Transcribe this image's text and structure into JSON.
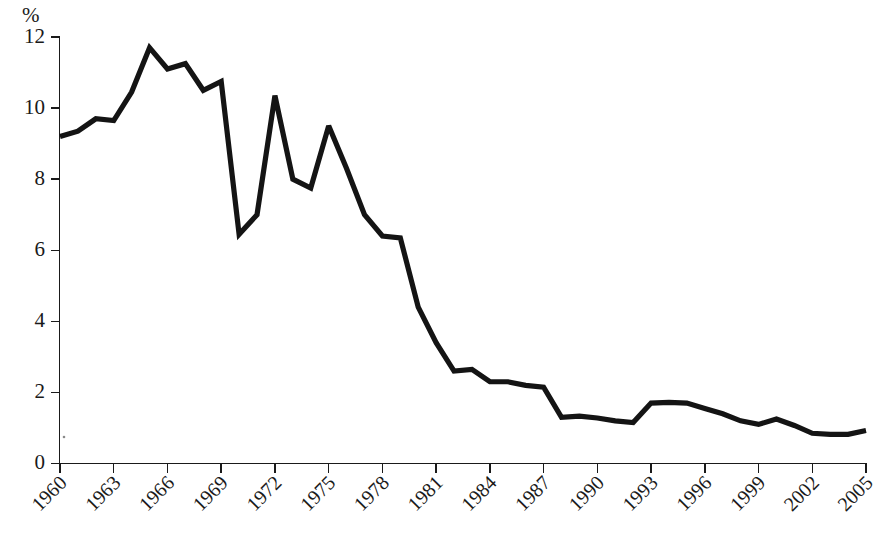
{
  "chart_data": {
    "type": "line",
    "title": "",
    "subtitle": "",
    "xlabel": "",
    "ylabel": "%",
    "ylim": [
      0,
      12
    ],
    "xlim": [
      1959,
      2005
    ],
    "yticks": [
      0,
      2,
      4,
      6,
      8,
      10,
      12
    ],
    "ytick_labels": [
      "0",
      "2",
      "4",
      "6",
      "8",
      "10",
      "12"
    ],
    "xticks": [
      1960,
      1963,
      1966,
      1969,
      1972,
      1975,
      1978,
      1981,
      1984,
      1987,
      1990,
      1993,
      1996,
      1999,
      2002,
      2005
    ],
    "xtick_labels": [
      "1960",
      "1963",
      "1966",
      "1969",
      "1972",
      "1975",
      "1978",
      "1981",
      "1984",
      "1987",
      "1990",
      "1993",
      "1996",
      "1999",
      "2002",
      "2005"
    ],
    "xtick_rotation": 45,
    "grid": false,
    "legend": null,
    "legend_position": "none",
    "line_color": "#141414",
    "line_width": 5.2,
    "x": [
      1960,
      1961,
      1962,
      1963,
      1964,
      1965,
      1966,
      1967,
      1968,
      1969,
      1970,
      1971,
      1972,
      1973,
      1974,
      1975,
      1976,
      1977,
      1978,
      1979,
      1980,
      1981,
      1982,
      1983,
      1984,
      1985,
      1986,
      1987,
      1988,
      1989,
      1990,
      1991,
      1992,
      1993,
      1994,
      1995,
      1996,
      1997,
      1998,
      1999,
      2000,
      2001,
      2002,
      2003,
      2004,
      2005
    ],
    "series": [
      {
        "name": "value",
        "values": [
          9.2,
          9.35,
          9.7,
          9.65,
          10.45,
          11.7,
          11.1,
          11.25,
          10.5,
          10.75,
          6.45,
          7.0,
          10.35,
          8.0,
          7.75,
          9.5,
          8.3,
          7.0,
          6.4,
          6.35,
          4.4,
          3.4,
          2.6,
          2.65,
          2.3,
          2.3,
          2.2,
          2.15,
          1.3,
          1.33,
          1.28,
          1.2,
          1.15,
          1.7,
          1.72,
          1.7,
          1.55,
          1.4,
          1.2,
          1.1,
          1.25,
          1.07,
          0.85,
          0.82,
          0.82,
          0.93
        ]
      }
    ]
  },
  "axes": {
    "y_unit_label": "%"
  }
}
